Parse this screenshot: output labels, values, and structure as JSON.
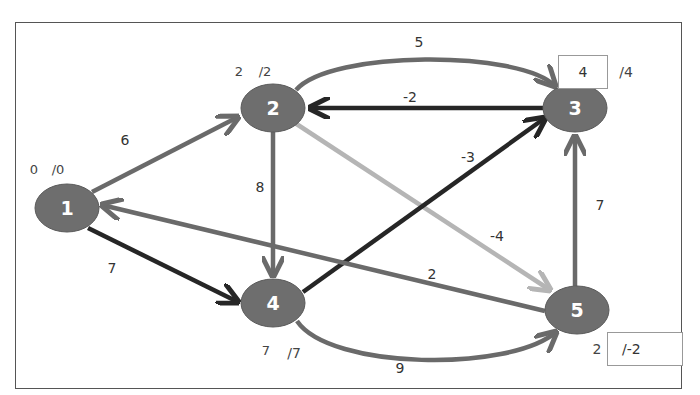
{
  "diagram": {
    "type": "directed weighted graph (shortest path / Bellman-Ford)",
    "colors": {
      "node_fill": "#6e6e6e",
      "node_text": "#ffffff",
      "edge_dark": "#262626",
      "edge_medium": "#6a6a6a",
      "edge_light": "#b5b5b5",
      "frame": "#555555"
    },
    "nodes": [
      {
        "id": "1",
        "label": "1",
        "x": 67,
        "y": 208,
        "dist_left": "0",
        "dist_right": "/0"
      },
      {
        "id": "2",
        "label": "2",
        "x": 273,
        "y": 108,
        "dist_left": "2",
        "dist_right": "/2"
      },
      {
        "id": "3",
        "label": "3",
        "x": 575,
        "y": 108,
        "dist_left": "4",
        "dist_right": "/4"
      },
      {
        "id": "4",
        "label": "4",
        "x": 273,
        "y": 303,
        "dist_left": "7",
        "dist_right": "/7"
      },
      {
        "id": "5",
        "label": "5",
        "x": 577,
        "y": 310,
        "dist_left": "2",
        "dist_right": "/-2"
      }
    ],
    "edges": [
      {
        "from": "1",
        "to": "2",
        "weight": "6",
        "style": "medium"
      },
      {
        "from": "1",
        "to": "4",
        "weight": "7",
        "style": "dark"
      },
      {
        "from": "2",
        "to": "3",
        "weight": "5",
        "style": "medium",
        "curved": true
      },
      {
        "from": "3",
        "to": "2",
        "weight": "-2",
        "style": "dark"
      },
      {
        "from": "2",
        "to": "4",
        "weight": "8",
        "style": "medium"
      },
      {
        "from": "2",
        "to": "5",
        "weight": "-4",
        "style": "light"
      },
      {
        "from": "4",
        "to": "3",
        "weight": "-3",
        "style": "dark"
      },
      {
        "from": "4",
        "to": "5",
        "weight": "9",
        "style": "medium",
        "curved": true
      },
      {
        "from": "5",
        "to": "1",
        "weight": "2",
        "style": "medium"
      },
      {
        "from": "5",
        "to": "3",
        "weight": "7",
        "style": "medium"
      }
    ]
  }
}
